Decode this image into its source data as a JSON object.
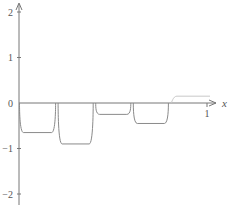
{
  "chart_data": {
    "type": "line",
    "title": "",
    "xlabel": "x",
    "ylabel": "",
    "xlim": [
      0,
      1.08
    ],
    "ylim": [
      -2.3,
      2.1
    ],
    "grid": false,
    "legend": null,
    "x_ticks": [
      {
        "value": 1,
        "label": "1"
      }
    ],
    "y_ticks": [
      {
        "value": 2,
        "label": "2"
      },
      {
        "value": 1,
        "label": "1"
      },
      {
        "value": 0,
        "label": "0"
      },
      {
        "value": -1,
        "label": "-1"
      },
      {
        "value": -2,
        "label": "-2"
      }
    ],
    "series": [
      {
        "name": "piecewise-constant approximation",
        "style": "smoothed steps",
        "segments": [
          {
            "x_start": 0.0,
            "x_end": 0.2,
            "value": -0.65
          },
          {
            "x_start": 0.2,
            "x_end": 0.4,
            "value": -0.9
          },
          {
            "x_start": 0.4,
            "x_end": 0.6,
            "value": -0.25
          },
          {
            "x_start": 0.6,
            "x_end": 0.8,
            "value": -0.45
          },
          {
            "x_start": 0.8,
            "x_end": 1.0,
            "value": 0.15
          }
        ]
      }
    ]
  },
  "colors": {
    "axis": "#777777",
    "curve": "#8a8a8a",
    "curve_light": "#c8c8c8",
    "text": "#555555"
  }
}
